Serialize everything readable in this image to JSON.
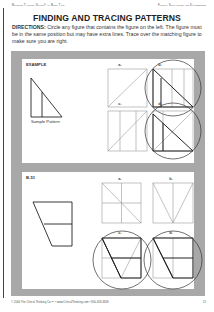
{
  "header": {
    "left": "Building Thinking Skills® — Book Two",
    "right": "Figural Similarities and Differences"
  },
  "title": "FINDING AND TRACING PATTERNS",
  "directions": {
    "label": "DIRECTIONS:",
    "text": " Circle any figure that contains the figure on the left. The figure must be in the same position but may have extra lines. Trace over the matching figure to make sure you are right."
  },
  "example": {
    "label": "EXAMPLE",
    "sample_caption": "Sample Pattern",
    "options": [
      {
        "label": "a.",
        "circled": false
      },
      {
        "label": "b.",
        "circled": true
      },
      {
        "label": "c.",
        "circled": false
      },
      {
        "label": "d.",
        "circled": true
      }
    ]
  },
  "exercise": {
    "label": "B-51",
    "options": [
      {
        "label": "a.",
        "circled": false
      },
      {
        "label": "b.",
        "circled": false
      },
      {
        "label": "c.",
        "circled": true
      },
      {
        "label": "d.",
        "circled": true
      }
    ]
  },
  "footer": {
    "copyright": "© 2006 The Critical Thinking Co.™ • www.CriticalThinking.com • 800-458-4849",
    "page_number": "15"
  },
  "colors": {
    "frame_gray": "#a8a8a8",
    "line_dark": "#222222",
    "line_light": "#999999"
  }
}
